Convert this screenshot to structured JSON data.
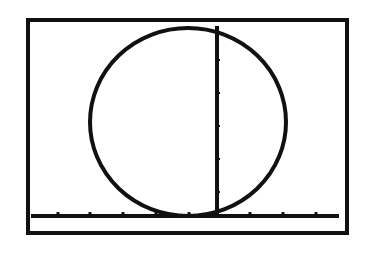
{
  "screen": {
    "type": "graphing-calculator-display",
    "background": "#ffffff",
    "ink": "#111111"
  },
  "graph": {
    "frame": {
      "x": 28,
      "y": 20,
      "w": 319,
      "h": 213
    },
    "x_axis": {
      "y": 216,
      "x1": 31,
      "x2": 339,
      "ticks_x": [
        58,
        90,
        123,
        156,
        189,
        250,
        283,
        316
      ]
    },
    "y_axis": {
      "x": 217,
      "y1": 26,
      "y2": 216,
      "ticks_y": [
        60,
        93,
        126,
        159,
        192
      ]
    },
    "circle": {
      "cx": 188,
      "cy": 122,
      "rx": 98,
      "ry": 94
    },
    "shapes": [
      "circle",
      "vertical-line",
      "horizontal-axis"
    ]
  }
}
